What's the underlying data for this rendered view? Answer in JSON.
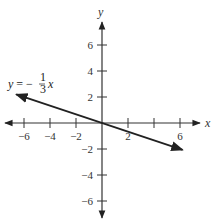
{
  "chart_data": {
    "type": "line",
    "title": "",
    "xlabel": "x",
    "ylabel": "y",
    "xlim": [
      -7.5,
      7.5
    ],
    "ylim": [
      -7.5,
      7.5
    ],
    "grid": false,
    "x_ticks": [
      -6,
      -4,
      -2,
      2,
      6
    ],
    "y_ticks": [
      6,
      4,
      2,
      -2,
      -4,
      -6
    ],
    "x_tick_labels": [
      "−6",
      "−4",
      "−2",
      "2",
      "6"
    ],
    "y_tick_labels": [
      "6",
      "4",
      "2",
      "−2",
      "−4",
      "−6"
    ],
    "all_x_tick_marks": [
      -6,
      -4,
      -2,
      2,
      4,
      6
    ],
    "series": [
      {
        "name": "y = −(1/3)x",
        "equation": "y = -1/3 x",
        "slope": -0.3333,
        "intercept": 0,
        "x": [
          -6.6,
          6.2
        ],
        "y": [
          2.2,
          -2.07
        ],
        "arrows_both_ends": true
      }
    ],
    "annotations": [
      {
        "text": "y = −⅓ x",
        "position": "upper-left, near left end of line"
      }
    ]
  },
  "labels": {
    "x_axis": "x",
    "y_axis": "y",
    "equation_prefix": "y = −",
    "fraction_num": "1",
    "fraction_den": "3",
    "equation_suffix": "x"
  }
}
